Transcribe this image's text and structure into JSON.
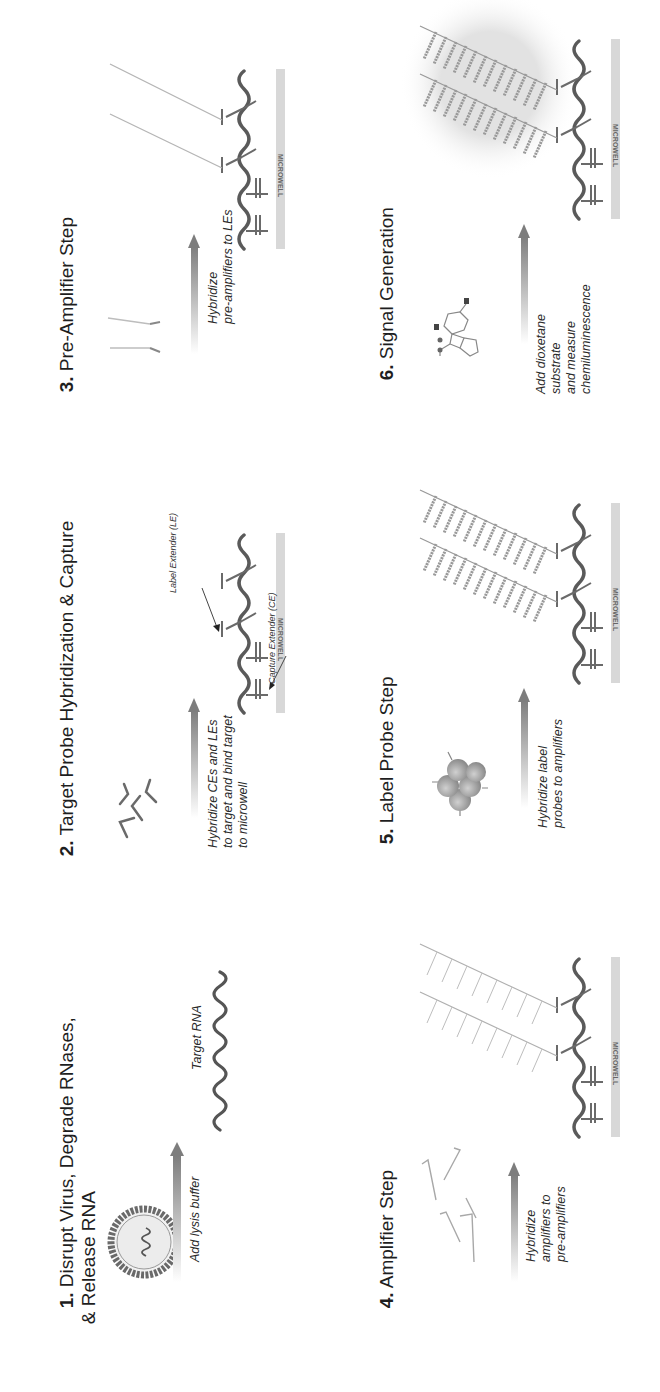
{
  "figure": {
    "steps": [
      {
        "number": "1.",
        "title": "Disrupt Virus, Degrade RNases,\n   & Release RNA",
        "caption": "Add lysis buffer",
        "labels": {
          "target": "Target RNA"
        },
        "icon": "virus-particle-icon"
      },
      {
        "number": "2.",
        "title": "Target Probe Hybridization & Capture",
        "caption": "Hybridize CEs and LEs\nto target and bind target\nto microwell",
        "labels": {
          "label_extender": "Label Extender (LE)",
          "capture_extender": "Capture Extender (CE)",
          "microwell": "MICROWELL"
        },
        "icon": "probe-fragments-icon"
      },
      {
        "number": "3.",
        "title": "Pre-Amplifier Step",
        "caption": "Hybridize\npre-amplifiers to LEs",
        "labels": {
          "microwell": "MICROWELL"
        },
        "icon": "pre-amplifier-icon"
      },
      {
        "number": "4.",
        "title": "Amplifier Step",
        "caption": "Hybridize\namplifiers to\npre-amplifiers",
        "labels": {
          "microwell": "MICROWELL"
        },
        "icon": "amplifier-icon"
      },
      {
        "number": "5.",
        "title": "Label Probe Step",
        "caption": "Hybridize label\nprobes to amplifiers",
        "labels": {
          "microwell": "MICROWELL"
        },
        "icon": "label-probe-enzyme-icon"
      },
      {
        "number": "6.",
        "title": "Signal Generation",
        "caption": "Add dioxetane\nsubstrate\nand measure\nchemiluminescence",
        "labels": {
          "microwell": "MICROWELL"
        },
        "icon": "dioxetane-molecule-icon"
      }
    ],
    "colors": {
      "strand": "#555555",
      "probe": "#777777",
      "light_probe": "#aaaaaa",
      "microwell": "#d6d6d6",
      "arrow": "#8a8a8a",
      "glow": "#e6e6e6"
    }
  }
}
